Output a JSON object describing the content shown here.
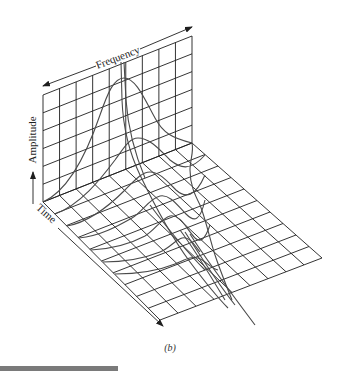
{
  "figure": {
    "caption": "(b)",
    "type": "3D waterfall / spectrogram diagram",
    "axes": {
      "frequency_label": "Frequency",
      "amplitude_label": "Amplitude",
      "time_label": "Time"
    },
    "grid": {
      "wall_columns": 9,
      "wall_rows": 6,
      "floor_time_rows": 10,
      "floor_freq_columns": 9
    },
    "colors": {
      "grid": "#1e1e1e",
      "curves": "#4a4a4a",
      "background": "#ffffff",
      "bottom_bar": "#7a7a7a"
    }
  }
}
